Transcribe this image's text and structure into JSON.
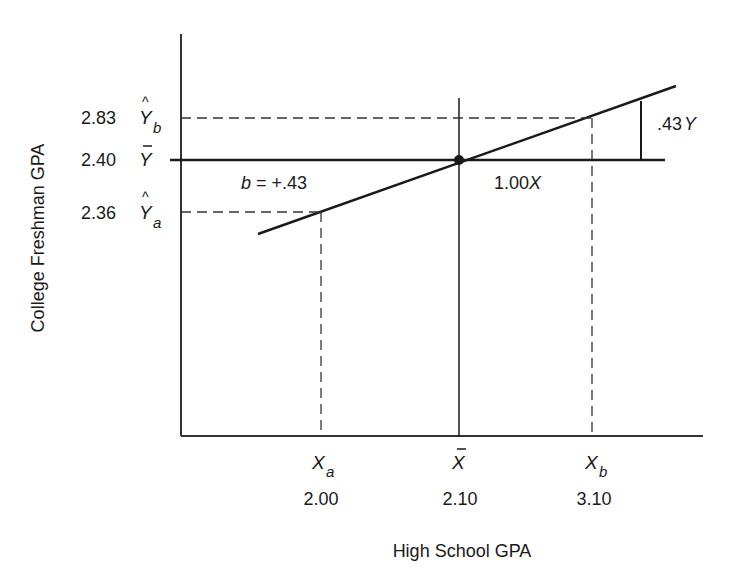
{
  "diagram": {
    "axes": {
      "x_label": "High School GPA",
      "y_label": "College Freshman GPA"
    },
    "y_ticks": [
      {
        "value": "2.83",
        "symbol": "Y",
        "hat": true,
        "bar": false,
        "subscript": "b"
      },
      {
        "value": "2.40",
        "symbol": "Y",
        "hat": false,
        "bar": true,
        "subscript": ""
      },
      {
        "value": "2.36",
        "symbol": "Y",
        "hat": true,
        "bar": false,
        "subscript": "a"
      }
    ],
    "x_ticks": [
      {
        "value": "2.00",
        "symbol": "X",
        "bar": false,
        "subscript": "a"
      },
      {
        "value": "2.10",
        "symbol": "X",
        "bar": true,
        "subscript": ""
      },
      {
        "value": "3.10",
        "symbol": "X",
        "bar": false,
        "subscript": "b"
      }
    ],
    "annotations": {
      "slope_b": "b",
      "slope_value": " = +.43",
      "run_label": "1.00",
      "run_var": "X",
      "rise_label": ".43",
      "rise_var": "Y"
    },
    "colors": {
      "ink": "#1a1a1a",
      "background": "#ffffff"
    }
  }
}
